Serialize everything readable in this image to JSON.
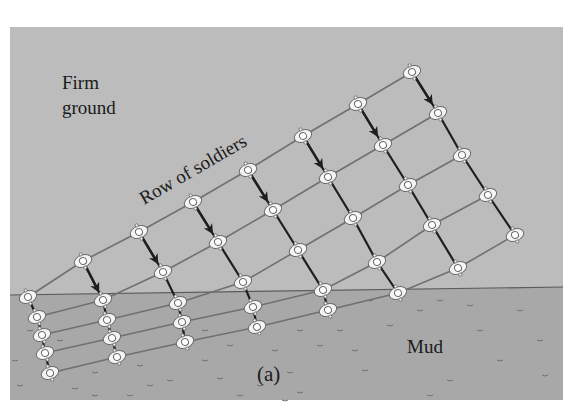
{
  "figure": {
    "label": "(a)",
    "labels": {
      "firm_line1": "Firm",
      "firm_line2": "ground",
      "row_label": "Row of soldiers",
      "mud": "Mud"
    },
    "colors": {
      "firm_ground": "#bcbcbc",
      "mud": "#a8a8a8",
      "row_line": "#707070",
      "column_line": "#1e1e1e",
      "boundary": "#5a5a5a",
      "soldier_fill": "#f4f4f4",
      "soldier_stroke": "#6a6a6a"
    },
    "panel": {
      "x": 10,
      "y": 27,
      "w": 553,
      "h": 373
    },
    "boundary": {
      "x1": 10,
      "y1": 295,
      "x2": 563,
      "y2": 287
    },
    "columns": [
      [
        [
          28,
          297
        ],
        [
          37,
          317
        ],
        [
          42,
          335
        ],
        [
          45,
          353
        ],
        [
          50,
          373
        ]
      ],
      [
        [
          83,
          261
        ],
        [
          103,
          300
        ],
        [
          107,
          320
        ],
        [
          112,
          338
        ],
        [
          117,
          357
        ]
      ],
      [
        [
          139,
          232
        ],
        [
          163,
          272
        ],
        [
          178,
          303
        ],
        [
          182,
          322
        ],
        [
          185,
          342
        ]
      ],
      [
        [
          193,
          202
        ],
        [
          218,
          242
        ],
        [
          243,
          282
        ],
        [
          253,
          307
        ],
        [
          257,
          327
        ]
      ],
      [
        [
          248,
          170
        ],
        [
          273,
          210
        ],
        [
          298,
          250
        ],
        [
          323,
          290
        ],
        [
          328,
          310
        ]
      ],
      [
        [
          303,
          136
        ],
        [
          328,
          177
        ],
        [
          353,
          218
        ],
        [
          377,
          262
        ],
        [
          398,
          293
        ]
      ],
      [
        [
          358,
          104
        ],
        [
          383,
          145
        ],
        [
          408,
          185
        ],
        [
          432,
          225
        ],
        [
          458,
          268
        ]
      ],
      [
        [
          412,
          72
        ],
        [
          438,
          113
        ],
        [
          462,
          155
        ],
        [
          488,
          195
        ],
        [
          515,
          235
        ]
      ]
    ],
    "arrows": [
      {
        "col": 1,
        "from": 0
      },
      {
        "col": 2,
        "from": 0
      },
      {
        "col": 3,
        "from": 0
      },
      {
        "col": 4,
        "from": 0
      },
      {
        "col": 5,
        "from": 0
      },
      {
        "col": 6,
        "from": 0
      },
      {
        "col": 7,
        "from": 0
      }
    ],
    "mud_marks": [
      [
        30,
        330
      ],
      [
        60,
        370
      ],
      [
        20,
        385
      ],
      [
        75,
        388
      ],
      [
        95,
        372
      ],
      [
        140,
        365
      ],
      [
        150,
        385
      ],
      [
        205,
        360
      ],
      [
        220,
        378
      ],
      [
        240,
        395
      ],
      [
        275,
        350
      ],
      [
        290,
        372
      ],
      [
        300,
        392
      ],
      [
        340,
        330
      ],
      [
        355,
        350
      ],
      [
        365,
        370
      ],
      [
        390,
        325
      ],
      [
        410,
        340
      ],
      [
        430,
        395
      ],
      [
        450,
        380
      ],
      [
        470,
        305
      ],
      [
        480,
        330
      ],
      [
        500,
        360
      ],
      [
        520,
        310
      ],
      [
        540,
        340
      ],
      [
        545,
        375
      ],
      [
        205,
        330
      ],
      [
        230,
        345
      ],
      [
        300,
        330
      ],
      [
        320,
        345
      ],
      [
        130,
        395
      ],
      [
        170,
        380
      ],
      [
        260,
        385
      ],
      [
        285,
        400
      ],
      [
        95,
        395
      ],
      [
        60,
        340
      ],
      [
        15,
        360
      ],
      [
        370,
        300
      ],
      [
        420,
        310
      ],
      [
        440,
        300
      ]
    ]
  }
}
